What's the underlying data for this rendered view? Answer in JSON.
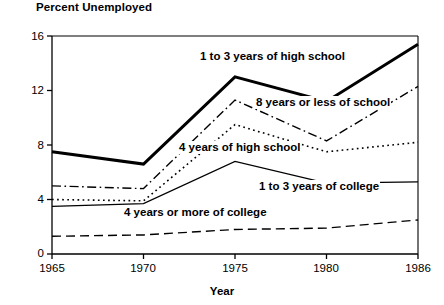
{
  "chart_data": {
    "type": "line",
    "title": "Percent Unemployed",
    "xlabel": "Year",
    "ylabel": "Percent Unemployed",
    "x": [
      1965,
      1970,
      1975,
      1980,
      1986
    ],
    "xtick_labels": [
      "1965",
      "1970",
      "1975",
      "1980",
      "1986"
    ],
    "ytick_labels": [
      "0",
      "4",
      "8",
      "12",
      "16"
    ],
    "yticks": [
      0,
      4,
      8,
      12,
      16
    ],
    "ylim": [
      0,
      16
    ],
    "grid": false,
    "legend_position": "inline-annotations",
    "series": [
      {
        "name": "1 to 3 years of high school",
        "values": [
          7.5,
          6.6,
          13.0,
          11.2,
          15.4
        ],
        "style": "thick-solid"
      },
      {
        "name": "8 years or less of school",
        "values": [
          5.0,
          4.8,
          11.3,
          8.3,
          12.3
        ],
        "style": "dash-dot"
      },
      {
        "name": "4 years of high school",
        "values": [
          4.0,
          3.9,
          9.5,
          7.5,
          8.2
        ],
        "style": "dotted"
      },
      {
        "name": "1 to 3 years of college",
        "values": [
          3.5,
          3.7,
          6.8,
          5.2,
          5.3
        ],
        "style": "thin-solid"
      },
      {
        "name": "4 years or more of college",
        "values": [
          1.3,
          1.4,
          1.8,
          1.9,
          2.5
        ],
        "style": "dashed"
      }
    ],
    "annotations": [
      {
        "text": "1 to 3 years of high school",
        "series": "1 to 3 years of high school"
      },
      {
        "text": "8 years or less of school",
        "series": "8 years or less of school"
      },
      {
        "text": "4 years of high school",
        "series": "4 years of high school"
      },
      {
        "text": "1 to 3 years of college",
        "series": "1 to 3 years of college"
      },
      {
        "text": "4 years or more of college",
        "series": "4 years or more of college"
      }
    ],
    "colors": {
      "line": "#000000",
      "axis": "#000000",
      "background": "#ffffff",
      "text": "#000000"
    }
  }
}
